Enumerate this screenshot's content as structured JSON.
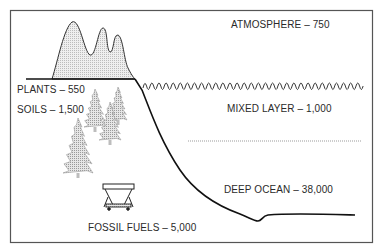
{
  "diagram": {
    "type": "carbon reservoirs",
    "reservoirs": [
      {
        "id": "atmosphere",
        "name": "ATMOSPHERE",
        "value": "750",
        "label": "ATMOSPHERE – 750"
      },
      {
        "id": "plants",
        "name": "PLANTS",
        "value": "550",
        "label": "PLANTS – 550"
      },
      {
        "id": "soils",
        "name": "SOILS",
        "value": "1,500",
        "label": "SOILS – 1,500"
      },
      {
        "id": "mixed_layer",
        "name": "MIXED LAYER",
        "value": "1,000",
        "label": "MIXED LAYER – 1,000"
      },
      {
        "id": "deep_ocean",
        "name": "DEEP OCEAN",
        "value": "38,000",
        "label": "DEEP OCEAN –  38,000"
      },
      {
        "id": "fossil_fuels",
        "name": "FOSSIL FUELS",
        "value": "5,000",
        "label": "FOSSIL FUELS – 5,000"
      }
    ],
    "icons": [
      "mountain-icon",
      "tree-icon",
      "coal-cart-icon",
      "wave-icon"
    ],
    "colors": {
      "line": "#1a1a1a",
      "border": "#555555",
      "fill_gray": "#c8c8c8",
      "dotted": "#bdbdbd"
    }
  }
}
